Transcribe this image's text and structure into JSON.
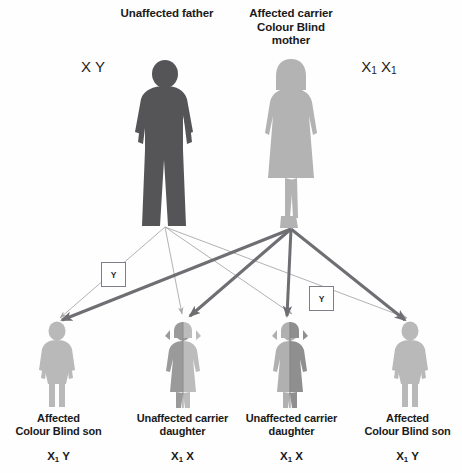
{
  "diagram": {
    "background_color": "#fefefe",
    "parents": [
      {
        "id": "father",
        "label": "Unaffected father",
        "genotype": "X Y",
        "genotype_plain": "X Y",
        "sex": "male",
        "silhouette_color": "#555558",
        "status": "unaffected"
      },
      {
        "id": "mother",
        "label": "Affected carrier\nColour Blind\nmother",
        "genotype": "X1 X1",
        "genotype_plain": "X₁ X₁",
        "sex": "female",
        "silhouette_color": "#b3b3b3",
        "status": "affected carrier"
      }
    ],
    "gamete_boxes": [
      {
        "label": "Y",
        "from": "father"
      },
      {
        "label": "Y",
        "from": "father"
      }
    ],
    "children": [
      {
        "id": "child-1",
        "label": "Affected\nColour Blind son",
        "genotype_plain": "X₁ Y",
        "sex": "male",
        "status": "affected",
        "silhouette_color": "#b9b9b9"
      },
      {
        "id": "child-2",
        "label": "Unaffected carrier\ndaughter",
        "genotype_plain": "X₁ X",
        "sex": "female",
        "status": "unaffected carrier",
        "silhouette_color": "#9a9a9a",
        "silhouette_color_alt": "#bcbcbc"
      },
      {
        "id": "child-3",
        "label": "Unaffected carrier\ndaughter",
        "genotype_plain": "X₁ X",
        "sex": "female",
        "status": "unaffected carrier",
        "silhouette_color": "#9a9a9a",
        "silhouette_color_alt": "#bcbcbc"
      },
      {
        "id": "child-4",
        "label": "Affected\nColour Blind son",
        "genotype_plain": "X₁ Y",
        "sex": "male",
        "status": "affected",
        "silhouette_color": "#b9b9b9"
      }
    ],
    "arrow_styles": {
      "father_line_color": "#a9a9ad",
      "father_line_width": 0.9,
      "mother_line_color": "#6e6e73",
      "mother_line_width": 3.0
    }
  }
}
